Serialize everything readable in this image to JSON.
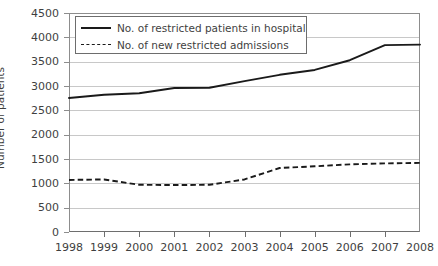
{
  "chart_data": {
    "type": "line",
    "title": "",
    "xlabel": "",
    "ylabel": "Number of patients",
    "x": [
      1998,
      1999,
      2000,
      2001,
      2002,
      2003,
      2004,
      2005,
      2006,
      2007,
      2008
    ],
    "categories": [
      "1998",
      "1999",
      "2000",
      "2001",
      "2002",
      "2003",
      "2004",
      "2005",
      "2006",
      "2007",
      "2008"
    ],
    "ylim": [
      0,
      4500
    ],
    "yticks": [
      0,
      500,
      1000,
      1500,
      2000,
      2500,
      3000,
      3500,
      4000,
      4500
    ],
    "ytick_labels": [
      "0",
      "500",
      "1000",
      "1500",
      "2000",
      "2500",
      "3000",
      "3500",
      "4000",
      "4500"
    ],
    "grid": true,
    "legend_position": "top-left",
    "series": [
      {
        "name": "No. of restricted patients in hospital",
        "style": "solid",
        "color": "#1a1a1a",
        "values": [
          2753,
          2820,
          2850,
          2960,
          2965,
          3100,
          3230,
          3330,
          3530,
          3840,
          3850
        ]
      },
      {
        "name": "No. of new restricted admissions",
        "style": "dashed",
        "color": "#1a1a1a",
        "values": [
          1070,
          1080,
          970,
          965,
          970,
          1080,
          1315,
          1350,
          1390,
          1410,
          1420
        ]
      }
    ]
  },
  "legend": {
    "items": [
      {
        "label": "No. of restricted patients in hospital",
        "swatch": "solid-line-swatch"
      },
      {
        "label": "No. of new restricted admissions",
        "swatch": "dashed-line-swatch"
      }
    ]
  },
  "axes": {
    "y_title": "Number of patients"
  }
}
